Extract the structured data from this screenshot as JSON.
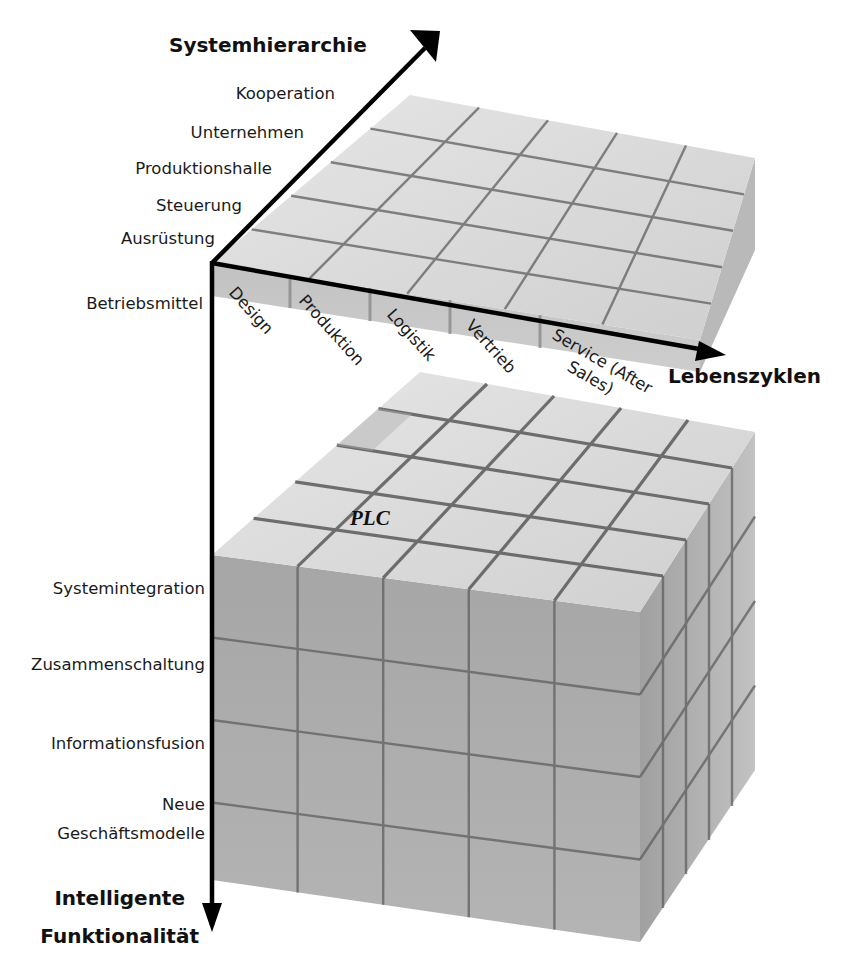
{
  "diagram": {
    "axes": {
      "system_hierarchy": {
        "title": "Systemhierarchie",
        "levels": [
          "Kooperation",
          "Unternehmen",
          "Produktionshalle",
          "Steuerung",
          "Ausrüstung",
          "Betriebsmittel"
        ]
      },
      "lifecycle": {
        "title": "Lebenszyklen",
        "stages": [
          "Design",
          "Produktion",
          "Logistik",
          "Vertrieb",
          "Service (After",
          "Sales)"
        ]
      },
      "intelligent_functionality": {
        "title_line1": "Intelligente",
        "title_line2": "Funktionalität",
        "levels": [
          "Systemintegration",
          "Zusammenschaltung",
          "Informationsfusion",
          "Neue",
          "Geschäftsmodelle"
        ]
      }
    },
    "highlight_cell": "PLC"
  },
  "colors": {
    "axis": "#000000",
    "top_face": "#dcdcdc",
    "front_face": "#a9a9a9",
    "side_face": "#b8b8b8",
    "grid": "#5a5a5a"
  }
}
